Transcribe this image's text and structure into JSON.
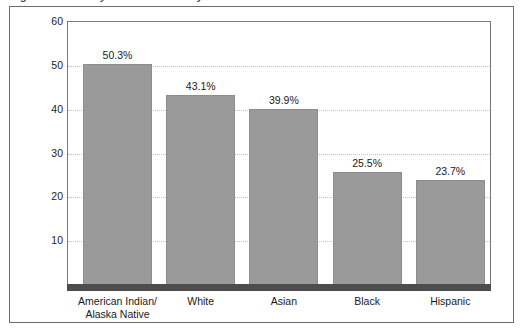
{
  "figure": {
    "title_clipped": "Figure. Percent by race and ethnicity",
    "frame_color": "#6b6b6b",
    "bar_color": "#9a9a9a",
    "axis_band_color": "#4d4d4d",
    "gridline_color": "#c2c2c2"
  },
  "chart_data": {
    "type": "bar",
    "title": "",
    "xlabel": "",
    "ylabel": "",
    "categories": [
      "American Indian/\nAlaska Native",
      "White",
      "Asian",
      "Black",
      "Hispanic"
    ],
    "values": [
      50.3,
      43.1,
      39.9,
      25.5,
      23.7
    ],
    "value_labels": [
      "50.3%",
      "43.1%",
      "39.9%",
      "25.5%",
      "23.7%"
    ],
    "ylim": [
      0,
      60
    ],
    "yticks": [
      60,
      50,
      40,
      30,
      20,
      10
    ],
    "ytick_labels": [
      "60",
      "50",
      "40",
      "30",
      "20",
      "10"
    ],
    "grid": true,
    "grid_axis": "y",
    "legend": false,
    "legend_position": "none",
    "series": [
      {
        "name": "Percent",
        "values": [
          50.3,
          43.1,
          39.9,
          25.5,
          23.7
        ]
      }
    ]
  }
}
